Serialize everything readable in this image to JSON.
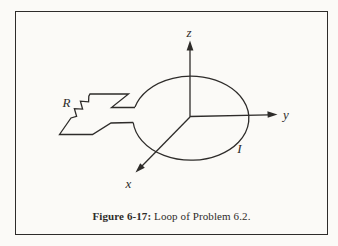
{
  "figure": {
    "caption": {
      "label": "Figure 6-17:",
      "text": " Loop of Problem 6.2."
    },
    "labels": {
      "axis_z": "z",
      "axis_y": "y",
      "axis_x": "x",
      "current": "I",
      "resistor": "R"
    },
    "colors": {
      "line": "#2e2c2a",
      "background": "#fbfaf7"
    }
  }
}
